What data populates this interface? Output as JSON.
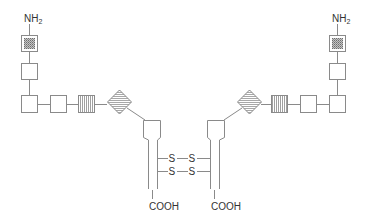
{
  "diagram": {
    "type": "antibody-like dimer schematic",
    "colors": {
      "stroke": "#8a8a8a",
      "text": "#333333",
      "stipple_fill": "#9a9a9a",
      "stripe": "#9a9a9a"
    },
    "left_chain": {
      "n_terminus": {
        "label": "NH",
        "subscript": "2"
      },
      "c_terminus": {
        "label": "COOH"
      },
      "domains": [
        {
          "shape": "square",
          "fill": "stippled"
        },
        {
          "shape": "square",
          "fill": "none"
        },
        {
          "shape": "square",
          "fill": "none"
        },
        {
          "shape": "square",
          "fill": "none"
        },
        {
          "shape": "square",
          "fill": "vertical-stripes"
        },
        {
          "shape": "diamond",
          "fill": "horizontal-stripes"
        },
        {
          "shape": "square-with-stem",
          "fill": "none"
        }
      ]
    },
    "right_chain": {
      "n_terminus": {
        "label": "NH",
        "subscript": "2"
      },
      "c_terminus": {
        "label": "COOH"
      },
      "domains": [
        {
          "shape": "square",
          "fill": "stippled"
        },
        {
          "shape": "square",
          "fill": "none"
        },
        {
          "shape": "square",
          "fill": "none"
        },
        {
          "shape": "square",
          "fill": "none"
        },
        {
          "shape": "square",
          "fill": "vertical-stripes"
        },
        {
          "shape": "diamond",
          "fill": "horizontal-stripes"
        },
        {
          "shape": "square-with-stem",
          "fill": "none"
        }
      ]
    },
    "disulfide_bonds": [
      {
        "left": "S",
        "right": "S"
      },
      {
        "left": "S",
        "right": "S"
      }
    ]
  }
}
